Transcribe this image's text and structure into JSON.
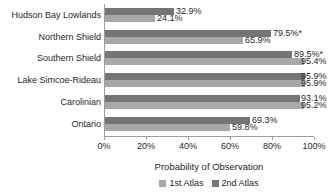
{
  "chart_data": {
    "type": "bar",
    "orientation": "horizontal",
    "xlabel": "Probability of Observation",
    "xlim": [
      0,
      100
    ],
    "xticks": [
      "0%",
      "20%",
      "40%",
      "60%",
      "80%",
      "100%"
    ],
    "grid": false,
    "categories": [
      "Hudson Bay Lowlands",
      "Northern Shield",
      "Southern Shield",
      "Lake Simcoe-Rideau",
      "Carolinian",
      "Ontario"
    ],
    "series": [
      {
        "name": "2nd Atlas",
        "color": "#757575",
        "values": [
          32.9,
          79.5,
          89.5,
          95.9,
          93.1,
          69.3
        ],
        "labels": [
          "32.9%",
          "79.5%*",
          "89.5%*",
          "95.9%",
          "93.1%",
          "69.3%"
        ]
      },
      {
        "name": "1st Atlas",
        "color": "#a8a8a8",
        "values": [
          24.1,
          65.9,
          95.4,
          95.9,
          95.2,
          59.8
        ],
        "labels": [
          "24.1%",
          "65.9%",
          "95.4%",
          "95.9%",
          "95.2%",
          "59.8%"
        ]
      }
    ],
    "legend": {
      "position": "bottom",
      "items": [
        {
          "label": "1st Atlas",
          "color": "#a8a8a8"
        },
        {
          "label": "2nd Atlas",
          "color": "#757575"
        }
      ]
    }
  },
  "colors": {
    "axis": "#9e9e9e",
    "text": "#262626",
    "background": "#ffffff"
  }
}
